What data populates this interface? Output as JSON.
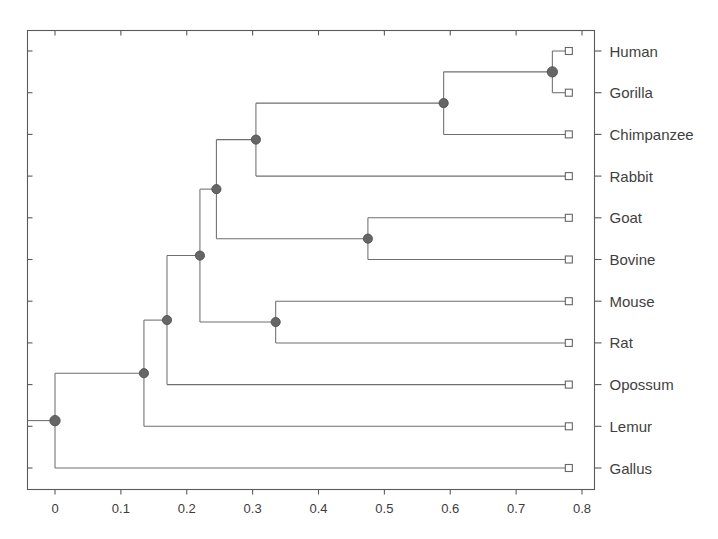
{
  "figure": {
    "type": "phylogenetic-tree",
    "background_color": "#ffffff",
    "line_color": "#6e6e6e",
    "node_color": "#666666",
    "text_color": "#3f3f3f"
  },
  "axis": {
    "label": "",
    "tick_labels": [
      "0",
      "0.1",
      "0.2",
      "0.3",
      "0.4",
      "0.5",
      "0.6",
      "0.7",
      "0.8"
    ],
    "tick_values": [
      0,
      0.1,
      0.2,
      0.3,
      0.4,
      0.5,
      0.6,
      0.7,
      0.8
    ],
    "min": 0,
    "max": 0.8
  },
  "leaves": [
    {
      "label": "Human",
      "distance": 0.78
    },
    {
      "label": "Gorilla",
      "distance": 0.78
    },
    {
      "label": "Chimpanzee",
      "distance": 0.78
    },
    {
      "label": "Rabbit",
      "distance": 0.78
    },
    {
      "label": "Goat",
      "distance": 0.78
    },
    {
      "label": "Bovine",
      "distance": 0.78
    },
    {
      "label": "Mouse",
      "distance": 0.78
    },
    {
      "label": "Rat",
      "distance": 0.78
    },
    {
      "label": "Opossum",
      "distance": 0.78
    },
    {
      "label": "Lemur",
      "distance": 0.78
    },
    {
      "label": "Gallus",
      "distance": 0.78
    }
  ],
  "internal_nodes": [
    {
      "name": "human-gorilla",
      "distance": 0.755,
      "children": [
        "Human",
        "Gorilla"
      ]
    },
    {
      "name": "hominids",
      "distance": 0.59,
      "children": [
        "human-gorilla",
        "Chimpanzee"
      ]
    },
    {
      "name": "primates-rabbit",
      "distance": 0.305,
      "children": [
        "hominids",
        "Rabbit"
      ]
    },
    {
      "name": "goat-bovine",
      "distance": 0.475,
      "children": [
        "Goat",
        "Bovine"
      ]
    },
    {
      "name": "euarchontoglires",
      "distance": 0.245,
      "children": [
        "primates-rabbit",
        "goat-bovine"
      ]
    },
    {
      "name": "mouse-rat",
      "distance": 0.335,
      "children": [
        "Mouse",
        "Rat"
      ]
    },
    {
      "name": "rodents-clade",
      "distance": 0.22,
      "children": [
        "euarchontoglires",
        "mouse-rat"
      ]
    },
    {
      "name": "opossum-split",
      "distance": 0.17,
      "children": [
        "rodents-clade",
        "Opossum"
      ]
    },
    {
      "name": "lemur-split",
      "distance": 0.135,
      "children": [
        "opossum-split",
        "Lemur"
      ]
    },
    {
      "name": "root",
      "distance": 0.0,
      "children": [
        "lemur-split",
        "Gallus"
      ]
    }
  ],
  "chart_data": {
    "type": "tree",
    "title": "",
    "xlabel": "",
    "ylabel": "",
    "xlim": [
      0,
      0.8
    ],
    "grid": false,
    "legend": "none",
    "taxa": [
      "Human",
      "Gorilla",
      "Chimpanzee",
      "Rabbit",
      "Goat",
      "Bovine",
      "Mouse",
      "Rat",
      "Opossum",
      "Lemur",
      "Gallus"
    ],
    "tip_distances": [
      0.78,
      0.78,
      0.78,
      0.78,
      0.78,
      0.78,
      0.78,
      0.78,
      0.78,
      0.78,
      0.78
    ],
    "node_distances": [
      0.755,
      0.59,
      0.305,
      0.475,
      0.245,
      0.335,
      0.22,
      0.17,
      0.135,
      0.0
    ],
    "node_names": [
      "human-gorilla",
      "hominids",
      "primates-rabbit",
      "goat-bovine",
      "euarchontoglires",
      "mouse-rat",
      "rodents-clade",
      "opossum-split",
      "lemur-split",
      "root"
    ],
    "axis_ticks": [
      0,
      0.1,
      0.2,
      0.3,
      0.4,
      0.5,
      0.6,
      0.7,
      0.8
    ],
    "axis_tick_labels": [
      "0",
      "0.1",
      "0.2",
      "0.3",
      "0.4",
      "0.5",
      "0.6",
      "0.7",
      "0.8"
    ]
  }
}
